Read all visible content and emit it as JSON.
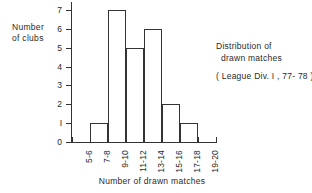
{
  "chart_data": {
    "type": "bar",
    "title": "",
    "categories": [
      "5-6",
      "7-8",
      "9-10",
      "11-12",
      "13-14",
      "15-16",
      "17-18",
      "19-20"
    ],
    "values": [
      0,
      1,
      7,
      5,
      6,
      2,
      1,
      0
    ],
    "xlabel": "Number of drawn matches",
    "ylabel_line1": "Number",
    "ylabel_line2": "of clubs",
    "ylim": [
      0,
      7
    ],
    "ytick_labels": [
      "0",
      "1",
      "2",
      "3",
      "4",
      "5",
      "6",
      "7"
    ],
    "grid": false,
    "legend": null,
    "annotation": {
      "line1": "Distribution of",
      "line2": "drawn matches",
      "line3": "( League Div. I , 77- 78 )"
    },
    "colors": {
      "axis": "#333333",
      "bar_outline": "#333333",
      "bar_fill": "#ffffff",
      "background": "#ffffff",
      "text": "#2a2a2a"
    }
  }
}
